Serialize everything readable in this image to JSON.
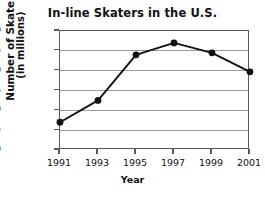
{
  "chart_data": {
    "type": "line",
    "title": "In-line Skaters in the U.S.",
    "xlabel": "Year",
    "ylabel": "Number of Skaters (in millions)",
    "ylabel_lines": [
      "Number of Skaters",
      "(in millions)"
    ],
    "categories": [
      "1991",
      "1993",
      "1995",
      "1997",
      "1999",
      "2001"
    ],
    "x": [
      1991,
      1993,
      1995,
      1997,
      1999,
      2001
    ],
    "values": [
      7.0,
      12.5,
      24.0,
      27.0,
      24.5,
      19.7
    ],
    "series": [
      {
        "name": "In-line skaters",
        "values": [
          7.0,
          12.5,
          24.0,
          27.0,
          24.5,
          19.7
        ]
      }
    ],
    "ylim": [
      0,
      30
    ],
    "xlim": [
      1991,
      2001
    ],
    "ytick_labels": [
      "$30",
      "$25",
      "$20",
      "$15",
      "$10",
      "$5",
      "0"
    ],
    "ytick_values": [
      30,
      25,
      20,
      15,
      10,
      5,
      0
    ],
    "grid": "horizontal",
    "legend": "none",
    "marker": "filled-circle",
    "line_color": "#111111",
    "marker_color": "#111111",
    "grid_color": "#9a9a9a",
    "axis_color": "#5a5a5a",
    "background": "#ffffff"
  }
}
